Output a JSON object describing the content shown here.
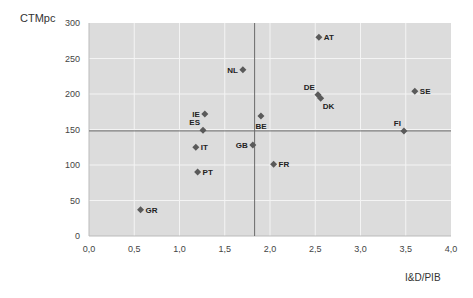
{
  "chart_data": {
    "type": "scatter",
    "title": "",
    "xlabel": "I&D/PIB",
    "ylabel": "CTMpc",
    "xlim": [
      0,
      4
    ],
    "ylim": [
      0,
      300
    ],
    "xticks": [
      "0,0",
      "0,5",
      "1,0",
      "1,5",
      "2,0",
      "2,5",
      "3,0",
      "3,5",
      "4,0"
    ],
    "yticks": [
      "0",
      "50",
      "100",
      "150",
      "200",
      "250",
      "300"
    ],
    "grid": true,
    "legend": "none",
    "reference_lines": {
      "x_mean": 1.83,
      "y_mean": 148
    },
    "points": [
      {
        "label": "AT",
        "x": 2.54,
        "y": 280,
        "label_pos": "right"
      },
      {
        "label": "NL",
        "x": 1.7,
        "y": 234,
        "label_pos": "left"
      },
      {
        "label": "SE",
        "x": 3.6,
        "y": 204,
        "label_pos": "right"
      },
      {
        "label": "DE",
        "x": 2.53,
        "y": 199,
        "label_pos": "left-up"
      },
      {
        "label": "DK",
        "x": 2.56,
        "y": 194,
        "label_pos": "right-down"
      },
      {
        "label": "IE",
        "x": 1.28,
        "y": 172,
        "label_pos": "left"
      },
      {
        "label": "BE",
        "x": 1.9,
        "y": 169,
        "label_pos": "below"
      },
      {
        "label": "ES",
        "x": 1.26,
        "y": 149,
        "label_pos": "left-up"
      },
      {
        "label": "FI",
        "x": 3.48,
        "y": 148,
        "label_pos": "left-up"
      },
      {
        "label": "GB",
        "x": 1.81,
        "y": 128,
        "label_pos": "left"
      },
      {
        "label": "IT",
        "x": 1.18,
        "y": 125,
        "label_pos": "right"
      },
      {
        "label": "FR",
        "x": 2.04,
        "y": 101,
        "label_pos": "right"
      },
      {
        "label": "PT",
        "x": 1.2,
        "y": 90,
        "label_pos": "right"
      },
      {
        "label": "GR",
        "x": 0.57,
        "y": 37,
        "label_pos": "right"
      }
    ]
  },
  "colors": {
    "plot_bg": "#dcdcdc",
    "grid": "#f4f4f4",
    "ref_line": "#6a6a6a",
    "marker": "#5a5a5a",
    "label": "#222222"
  }
}
